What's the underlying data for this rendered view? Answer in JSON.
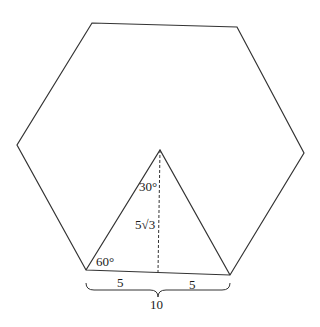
{
  "diagram": {
    "hexagon": {
      "vertices": [
        [
          92,
          23
        ],
        [
          237,
          27
        ],
        [
          304,
          153
        ],
        [
          230,
          275
        ],
        [
          86,
          270
        ],
        [
          17,
          145
        ]
      ],
      "stroke": "#333333"
    },
    "triangle": {
      "apex": [
        160,
        150
      ],
      "base_left": [
        86,
        270
      ],
      "base_right": [
        230,
        275
      ],
      "altitude_foot": [
        158,
        272
      ]
    },
    "labels": {
      "apex_angle": "30°",
      "base_angle": "60°",
      "height": "5√3",
      "left_half": "5",
      "right_half": "5",
      "base_total": "10"
    },
    "colors": {
      "line": "#333333",
      "text": "#1a1a1a",
      "background": "#ffffff"
    }
  }
}
